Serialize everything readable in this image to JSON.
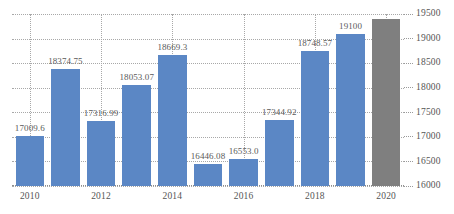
{
  "chart_data": {
    "type": "bar",
    "title": "",
    "subtitle": "",
    "xlabel": "",
    "ylabel": "",
    "categories": [
      "2010",
      "2011",
      "2012",
      "2013",
      "2014",
      "2015",
      "2016",
      "2017",
      "2018",
      "2019",
      "2020"
    ],
    "values": [
      17009.6,
      18374.75,
      17316.99,
      18053.07,
      18669.3,
      16446.08,
      16553.0,
      17344.92,
      18748.57,
      19100,
      19400
    ],
    "point_labels": [
      "17009.6",
      "18374.75",
      "17316.99",
      "18053.07",
      "18669.3",
      "16446.08",
      "16553.0",
      "17344.92",
      "18748.57",
      "19100",
      ""
    ],
    "bar_colors": [
      "#5b87c5",
      "#5b87c5",
      "#5b87c5",
      "#5b87c5",
      "#5b87c5",
      "#5b87c5",
      "#5b87c5",
      "#5b87c5",
      "#5b87c5",
      "#5b87c5",
      "#7f7f7f"
    ],
    "ylim": [
      16000,
      19500
    ],
    "ytick_values": [
      16000,
      16500,
      17000,
      17500,
      18000,
      18500,
      19000,
      19500
    ],
    "ytick_labels": [
      "16000",
      "16500",
      "17000",
      "17500",
      "18000",
      "18500",
      "19000",
      "19500"
    ],
    "xtick_labels": [
      "2010",
      "2012",
      "2014",
      "2016",
      "2018",
      "2020"
    ],
    "xtick_indices": [
      0,
      2,
      4,
      6,
      8,
      10
    ],
    "grid": {
      "horizontal": true,
      "vertical": true,
      "style": "dotted",
      "color": "#a8a8a8"
    },
    "legend": {
      "visible": false,
      "position": "none",
      "entries": []
    },
    "axis": {
      "y_position": "right",
      "x_position": "bottom"
    },
    "colors": {
      "series_primary": "#5b87c5",
      "highlight": "#7f7f7f",
      "grid": "#a8a8a8",
      "text": "#555555",
      "background": "#ffffff"
    }
  }
}
